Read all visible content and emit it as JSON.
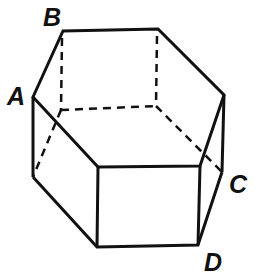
{
  "diagram": {
    "type": "hexagonal-prism",
    "labels": {
      "A": "A",
      "B": "B",
      "C": "C",
      "D": "D"
    },
    "colors": {
      "line": "#111111",
      "background": "#ffffff"
    }
  }
}
